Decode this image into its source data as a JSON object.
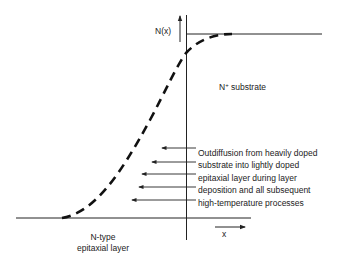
{
  "diagram": {
    "y_axis_label": "N(x)",
    "x_axis_label": "x",
    "substrate_label_main": "N",
    "substrate_label_sup": "+",
    "substrate_label_rest": " substrate",
    "epi_label_line1": "N-type",
    "epi_label_line2": "epitaxial layer",
    "annotation_lines": [
      "Outdiffusion from heavily doped",
      "substrate into lightly doped",
      "epitaxial layer during layer",
      "deposition and all subsequent",
      "high-temperature processes"
    ],
    "line_color": "#222222",
    "curve_style": "dashed"
  }
}
